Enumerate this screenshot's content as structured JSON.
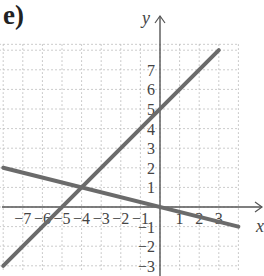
{
  "panel_label": "e)",
  "chart_data": {
    "type": "line",
    "title": "",
    "xlabel": "x",
    "ylabel": "y",
    "xlim": [
      -8,
      4
    ],
    "ylim": [
      -3,
      8
    ],
    "grid": true,
    "x_ticks": [
      -7,
      -6,
      -5,
      -4,
      -3,
      -2,
      -1,
      1,
      2,
      3
    ],
    "y_ticks": [
      -3,
      -2,
      -1,
      1,
      2,
      3,
      4,
      5,
      6,
      7
    ],
    "series": [
      {
        "name": "line-1",
        "equation": "y = x + 5",
        "x": [
          -8,
          3
        ],
        "y": [
          -3,
          8
        ]
      },
      {
        "name": "line-2",
        "equation": "y = -x/4",
        "x": [
          -8,
          4
        ],
        "y": [
          2,
          -1
        ]
      }
    ],
    "annotations": [
      {
        "type": "intersection",
        "x": -4,
        "y": 1
      }
    ],
    "colors": {
      "line": "#6b6b6b",
      "axis": "#555555",
      "grid": "#bbbbbb"
    }
  }
}
